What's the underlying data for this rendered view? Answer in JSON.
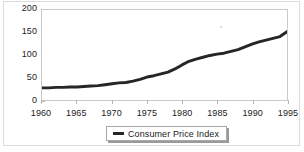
{
  "chart_data": {
    "type": "line",
    "title": "",
    "subtitle": "",
    "xlabel": "",
    "ylabel": "",
    "xlim": [
      1960,
      1995
    ],
    "ylim": [
      0,
      200
    ],
    "grid": false,
    "legend_position": "bottom-center",
    "legend": [
      "Consumer Price Index"
    ],
    "yticks": [
      {
        "label": "200",
        "value": 200
      },
      {
        "label": "150",
        "value": 150
      },
      {
        "label": "100",
        "value": 100
      },
      {
        "label": "50",
        "value": 50
      },
      {
        "label": "0",
        "value": 0
      }
    ],
    "xticks": [
      {
        "label": "1960",
        "value": 1960
      },
      {
        "label": "1965",
        "value": 1965
      },
      {
        "label": "1970",
        "value": 1970
      },
      {
        "label": "1975",
        "value": 1975
      },
      {
        "label": "1980",
        "value": 1980
      },
      {
        "label": "1985",
        "value": 1985
      },
      {
        "label": "1990",
        "value": 1990
      },
      {
        "label": "1995",
        "value": 1995
      }
    ],
    "series": [
      {
        "name": "Consumer Price Index",
        "color": "#262626",
        "line_width": 3,
        "x": [
          1960,
          1961,
          1962,
          1963,
          1964,
          1965,
          1966,
          1967,
          1968,
          1969,
          1970,
          1971,
          1972,
          1973,
          1974,
          1975,
          1976,
          1977,
          1978,
          1979,
          1980,
          1981,
          1982,
          1983,
          1984,
          1985,
          1986,
          1987,
          1988,
          1989,
          1990,
          1991,
          1992,
          1993,
          1994,
          1995
        ],
        "values": [
          27,
          27,
          28,
          28,
          29,
          29,
          30,
          31,
          32,
          34,
          36,
          38,
          39,
          42,
          46,
          51,
          54,
          58,
          62,
          69,
          78,
          86,
          91,
          95,
          99,
          102,
          104,
          108,
          112,
          118,
          124,
          129,
          133,
          137,
          141,
          152
        ]
      }
    ]
  },
  "legend": {
    "swatch_name": "line-swatch",
    "label": "Consumer Price Index"
  },
  "colors": {
    "series": "#262626",
    "axis": "#b5b5b5",
    "plot_border": "#c9c9c9",
    "outer_border": "#dcdcdc",
    "text": "#1a1a1a",
    "background": "#ffffff"
  }
}
